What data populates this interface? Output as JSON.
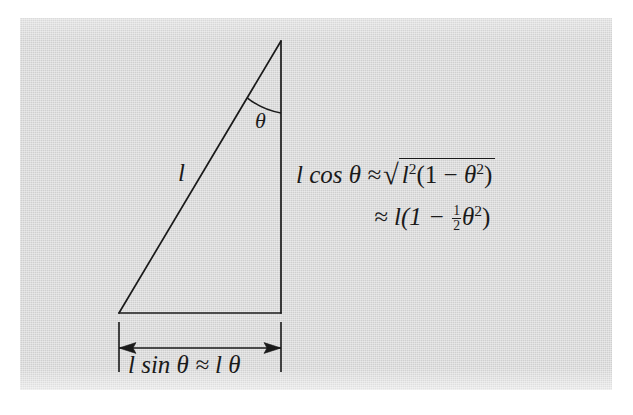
{
  "figure": {
    "name": "small-angle-approximation-triangle",
    "background_color": "#ffffff",
    "panel_color": "#cfcfcf",
    "ink_color": "#1a1a1a"
  },
  "labels": {
    "hypotenuse": "l",
    "angle": "θ",
    "cos_lhs": "l cos θ ≈",
    "radical_sign": "√",
    "radicand_l": "l",
    "radicand_l_exp": "2",
    "radicand_open": "(1 − ",
    "radicand_theta": "θ",
    "radicand_theta_exp": "2",
    "radicand_close": ")",
    "second_line_prefix": "≈ l(1 − ",
    "fraction_numerator": "1",
    "fraction_denominator": "2",
    "second_line_theta": "θ",
    "second_line_theta_exp": "2",
    "second_line_close": ")",
    "base_dimension": "l sin θ ≈ l θ"
  },
  "geometry": {
    "apex": {
      "x": 281,
      "y": 41
    },
    "bottom_right": {
      "x": 281,
      "y": 313
    },
    "bottom_left": {
      "x": 119,
      "y": 313
    },
    "dimension_line_y": 348,
    "extension_left_x": 119,
    "extension_right_x": 281,
    "extension_top_y": 322,
    "extension_bottom_y": 372,
    "angle_arc_radius": 72
  }
}
